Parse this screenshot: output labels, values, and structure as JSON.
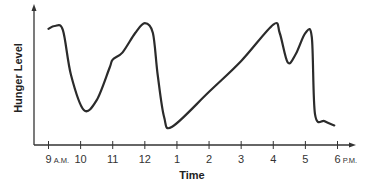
{
  "chart_data": {
    "type": "line",
    "title": "",
    "xlabel": "Time",
    "ylabel": "Hunger Level",
    "x_tick_labels": [
      {
        "hour": 9,
        "label": "9",
        "suffix": "A.M."
      },
      {
        "hour": 10,
        "label": "10",
        "suffix": ""
      },
      {
        "hour": 11,
        "label": "11",
        "suffix": ""
      },
      {
        "hour": 12,
        "label": "12",
        "suffix": ""
      },
      {
        "hour": 13,
        "label": "1",
        "suffix": ""
      },
      {
        "hour": 14,
        "label": "2",
        "suffix": ""
      },
      {
        "hour": 15,
        "label": "3",
        "suffix": ""
      },
      {
        "hour": 16,
        "label": "4",
        "suffix": ""
      },
      {
        "hour": 17,
        "label": "5",
        "suffix": ""
      },
      {
        "hour": 18,
        "label": "6",
        "suffix": "P.M."
      }
    ],
    "y_ticks": [],
    "ylim": [
      0,
      100
    ],
    "xlim": [
      9,
      18
    ],
    "grid": false,
    "legend": null,
    "line_color": "#2b2b2b",
    "series": [
      {
        "name": "Hunger Level",
        "points": [
          {
            "x": 9.0,
            "y": 83
          },
          {
            "x": 9.2,
            "y": 85
          },
          {
            "x": 9.45,
            "y": 82
          },
          {
            "x": 9.7,
            "y": 50
          },
          {
            "x": 10.1,
            "y": 25
          },
          {
            "x": 10.5,
            "y": 32
          },
          {
            "x": 10.9,
            "y": 55
          },
          {
            "x": 11.0,
            "y": 61
          },
          {
            "x": 11.3,
            "y": 66
          },
          {
            "x": 11.7,
            "y": 80
          },
          {
            "x": 12.0,
            "y": 87
          },
          {
            "x": 12.25,
            "y": 80
          },
          {
            "x": 12.4,
            "y": 50
          },
          {
            "x": 12.6,
            "y": 20
          },
          {
            "x": 12.85,
            "y": 13
          },
          {
            "x": 14.0,
            "y": 38
          },
          {
            "x": 15.0,
            "y": 60
          },
          {
            "x": 16.0,
            "y": 86
          },
          {
            "x": 16.2,
            "y": 80
          },
          {
            "x": 16.45,
            "y": 59
          },
          {
            "x": 16.7,
            "y": 65
          },
          {
            "x": 17.0,
            "y": 80
          },
          {
            "x": 17.2,
            "y": 77
          },
          {
            "x": 17.3,
            "y": 22
          },
          {
            "x": 17.6,
            "y": 17
          },
          {
            "x": 17.9,
            "y": 14
          }
        ]
      }
    ]
  }
}
